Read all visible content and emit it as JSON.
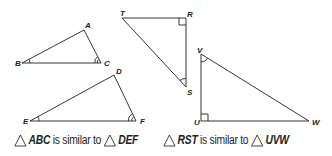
{
  "triangles": [
    {
      "id": "ABC",
      "vertices": {
        "A": {
          "x": 84,
          "y": 30
        },
        "B": {
          "x": 22,
          "y": 63
        },
        "C": {
          "x": 101,
          "y": 63
        }
      },
      "angle_marks": {
        "B": "single-arc",
        "C": "double-arc"
      }
    },
    {
      "id": "DEF",
      "vertices": {
        "D": {
          "x": 114,
          "y": 75
        },
        "E": {
          "x": 30,
          "y": 121
        },
        "F": {
          "x": 136,
          "y": 121
        }
      },
      "angle_marks": {
        "E": "single-arc",
        "F": "double-arc"
      }
    },
    {
      "id": "RST",
      "vertices": {
        "R": {
          "x": 186,
          "y": 18
        },
        "S": {
          "x": 186,
          "y": 87
        },
        "T": {
          "x": 122,
          "y": 18
        }
      },
      "angle_marks": {
        "R": "right-angle",
        "S": "single-arc"
      }
    },
    {
      "id": "UVW",
      "vertices": {
        "U": {
          "x": 201,
          "y": 121
        },
        "V": {
          "x": 201,
          "y": 54
        },
        "W": {
          "x": 309,
          "y": 121
        }
      },
      "angle_marks": {
        "U": "right-angle",
        "V": "single-arc"
      }
    }
  ],
  "labels": {
    "A": "A",
    "B": "B",
    "C": "C",
    "D": "D",
    "E": "E",
    "F": "F",
    "R": "R",
    "S": "S",
    "T": "T",
    "U": "U",
    "V": "V",
    "W": "W"
  },
  "captions": [
    {
      "first": "ABC",
      "connector": "is similar to",
      "second": "DEF",
      "symbol": "triangle-icon"
    },
    {
      "first": "RST",
      "connector": "is similar to",
      "second": "UVW",
      "symbol": "triangle-icon"
    }
  ],
  "colors": {
    "stroke": "#231f20",
    "background": "#ffffff"
  }
}
